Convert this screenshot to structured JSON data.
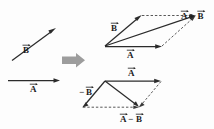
{
  "figure": {
    "background_color": "#fdfdfd",
    "ink_color": "#2b2b2b",
    "block_arrow_color": "#9d9d9d",
    "width": 214,
    "height": 129
  },
  "labels": {
    "b_left": "B",
    "a_left": "A",
    "b_top": "B",
    "a_top": "A",
    "a_plus_b": "A",
    "a_plus_b_op": "+",
    "a_plus_b_second": "B",
    "a_bottom": "A",
    "minus_b": "B",
    "minus_sign": "−",
    "a_minus_b_first": "A",
    "a_minus_b_op": "−",
    "a_minus_b_second": "B"
  },
  "panels": {
    "left": {
      "name": "given-vectors",
      "vectors": [
        {
          "name": "B",
          "label": "B",
          "from": [
            12,
            60
          ],
          "to": [
            56,
            28
          ],
          "style": "solid"
        },
        {
          "name": "A",
          "label": "A",
          "from": [
            8,
            80
          ],
          "to": [
            60,
            80
          ],
          "style": "solid"
        }
      ]
    },
    "transition": {
      "name": "implies-arrow",
      "glyph": "block-right-arrow",
      "x": 61,
      "y": 53,
      "width": 24,
      "height": 14
    },
    "top_right": {
      "name": "vector-sum-parallelogram",
      "origin": [
        105,
        46
      ],
      "vectors": [
        {
          "name": "A",
          "label": "A",
          "from": [
            105,
            46
          ],
          "to": [
            162,
            46
          ],
          "style": "solid"
        },
        {
          "name": "B",
          "label": "B",
          "from": [
            105,
            46
          ],
          "to": [
            141,
            15
          ],
          "style": "solid"
        },
        {
          "name": "A+B",
          "label": "A+B",
          "from": [
            105,
            46
          ],
          "to": [
            196,
            15
          ],
          "style": "solid"
        }
      ],
      "construction_lines": [
        {
          "from": [
            141,
            15
          ],
          "to": [
            196,
            15
          ],
          "style": "dashed"
        },
        {
          "from": [
            162,
            46
          ],
          "to": [
            196,
            15
          ],
          "style": "dashed"
        }
      ]
    },
    "bottom_right": {
      "name": "vector-difference-parallelogram",
      "origin": [
        105,
        81
      ],
      "vectors": [
        {
          "name": "A",
          "label": "A",
          "from": [
            105,
            81
          ],
          "to": [
            161,
            81
          ],
          "style": "solid"
        },
        {
          "name": "-B",
          "label": "−B",
          "from": [
            105,
            81
          ],
          "to": [
            82,
            107
          ],
          "style": "solid"
        },
        {
          "name": "A-B",
          "label": "A−B",
          "from": [
            105,
            81
          ],
          "to": [
            139,
            107
          ],
          "style": "solid"
        }
      ],
      "construction_lines": [
        {
          "from": [
            82,
            107
          ],
          "to": [
            139,
            107
          ],
          "style": "dashed"
        },
        {
          "from": [
            161,
            81
          ],
          "to": [
            139,
            107
          ],
          "style": "dashed"
        }
      ]
    }
  }
}
